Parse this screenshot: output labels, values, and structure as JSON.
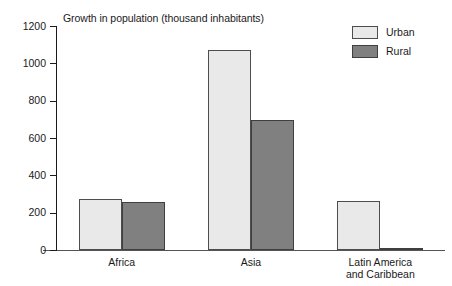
{
  "chart_data": {
    "type": "bar",
    "title": "Growth in population (thousand inhabitants)",
    "xlabel": "",
    "ylabel": "",
    "ylim": [
      0,
      1200
    ],
    "yticks": [
      0,
      200,
      400,
      600,
      800,
      1000,
      1200
    ],
    "ytick_labels": [
      "0",
      "200",
      "400",
      "600",
      "800",
      "1000",
      "1200"
    ],
    "grid": false,
    "legend_position": "top-right",
    "categories": [
      "Africa",
      "Asia",
      "Latin America\nand Caribbean"
    ],
    "category_labels_flat": [
      "Africa",
      "Asia",
      "Latin America and Caribbean"
    ],
    "series": [
      {
        "name": "Urban",
        "color": "#e9e9e9",
        "values": [
          275,
          1071,
          262
        ]
      },
      {
        "name": "Rural",
        "color": "#808080",
        "values": [
          258,
          697,
          10
        ]
      }
    ]
  },
  "legend": {
    "items": [
      {
        "label": "Urban",
        "swatch": "urban-swatch"
      },
      {
        "label": "Rural",
        "swatch": "rural-swatch"
      }
    ]
  },
  "colors": {
    "urban": "#e9e9e9",
    "rural": "#808080",
    "axis": "#1a1a1a",
    "background": "#ffffff"
  }
}
